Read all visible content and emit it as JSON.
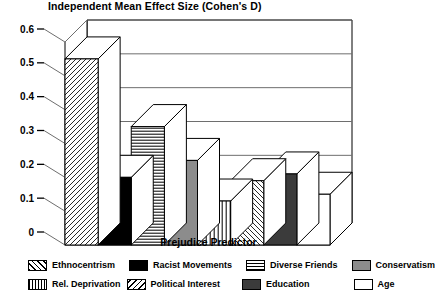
{
  "chart_data": {
    "type": "bar",
    "title": "Independent Mean Effect Size (Cohen's D)",
    "xlabel": "Prejudice Predictor",
    "ylabel": "",
    "ylim": [
      0,
      0.6
    ],
    "grid": true,
    "legend_position": "bottom",
    "style": "3d-bar",
    "yticks": [
      "0.6",
      "0.5",
      "0.4",
      "0.3",
      "0.2",
      "0.1",
      "0"
    ],
    "ytick_values": [
      0.6,
      0.5,
      0.4,
      0.3,
      0.2,
      0.1,
      0
    ],
    "categories": [
      "Ethnocentrism",
      "Racist Movements",
      "Diverse Friends",
      "Conservatism",
      "Rel. Deprivation",
      "Political Interest",
      "Education",
      "Age"
    ],
    "values": [
      0.55,
      0.2,
      0.35,
      0.25,
      0.13,
      0.19,
      0.21,
      0.15
    ],
    "series": [
      {
        "name": "Independent Mean Effect Size (Cohen's D)",
        "values": [
          0.55,
          0.2,
          0.35,
          0.25,
          0.13,
          0.19,
          0.21,
          0.15
        ]
      }
    ],
    "bars": [
      {
        "label": "Ethnocentrism",
        "value": 0.55,
        "pattern": "diagonal-forward",
        "fill": "#ffffff"
      },
      {
        "label": "Racist Movements",
        "value": 0.2,
        "pattern": "solid",
        "fill": "#000000"
      },
      {
        "label": "Diverse Friends",
        "value": 0.35,
        "pattern": "horizontal",
        "fill": "#ffffff"
      },
      {
        "label": "Conservatism",
        "value": 0.25,
        "pattern": "solid",
        "fill": "#8c8c8c"
      },
      {
        "label": "Rel. Deprivation",
        "value": 0.13,
        "pattern": "vertical",
        "fill": "#ffffff"
      },
      {
        "label": "Political Interest",
        "value": 0.19,
        "pattern": "diagonal-back",
        "fill": "#ffffff"
      },
      {
        "label": "Education",
        "value": 0.21,
        "pattern": "solid",
        "fill": "#3b3b3b"
      },
      {
        "label": "Age",
        "value": 0.15,
        "pattern": "solid",
        "fill": "#ffffff"
      }
    ],
    "legend": [
      {
        "label": "Ethnocentrism",
        "pattern": "diagonal-forward",
        "fill": "#ffffff"
      },
      {
        "label": "Racist Movements",
        "pattern": "solid",
        "fill": "#000000"
      },
      {
        "label": "Diverse Friends",
        "pattern": "horizontal",
        "fill": "#ffffff"
      },
      {
        "label": "Conservatism",
        "pattern": "solid",
        "fill": "#8c8c8c"
      },
      {
        "label": "Rel. Deprivation",
        "pattern": "vertical",
        "fill": "#ffffff"
      },
      {
        "label": "Political Interest",
        "pattern": "diagonal-back",
        "fill": "#ffffff"
      },
      {
        "label": "Education",
        "pattern": "solid",
        "fill": "#3b3b3b"
      },
      {
        "label": "Age",
        "pattern": "solid",
        "fill": "#ffffff"
      }
    ],
    "colors": {
      "axis": "#000000",
      "grid": "#6e6e6e",
      "background": "#ffffff"
    }
  }
}
